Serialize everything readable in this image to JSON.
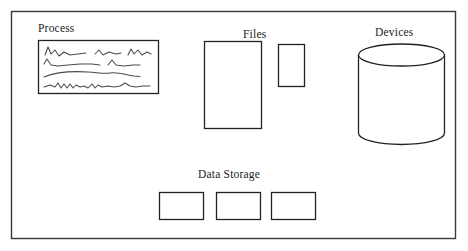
{
  "diagram": {
    "background_color": "#ffffff",
    "frame": {
      "name": "outer-frame",
      "stroke_color": "#333333",
      "x": 11,
      "y": 11,
      "width": 444,
      "height": 228
    },
    "groups": [
      {
        "id": "process",
        "label": "Process",
        "shape": "rectangle-with-scribbles",
        "label_x": 38,
        "label_y": 22,
        "box": {
          "x": 38,
          "y": 40,
          "width": 120,
          "height": 53
        },
        "scribble_rows": 4,
        "stroke_color": "#222222"
      },
      {
        "id": "files",
        "label": "Files",
        "shape": "rectangles",
        "label_x": 243,
        "label_y": 28,
        "rects": [
          {
            "name": "file-rect-large",
            "x": 204,
            "y": 41,
            "width": 57,
            "height": 87
          },
          {
            "name": "file-rect-small",
            "x": 278,
            "y": 44,
            "width": 26,
            "height": 42
          }
        ],
        "stroke_color": "#222222"
      },
      {
        "id": "devices",
        "label": "Devices",
        "shape": "cylinder",
        "label_x": 375,
        "label_y": 26,
        "cylinder": {
          "x": 358,
          "y": 44,
          "width": 86,
          "height": 100,
          "ellipse_ry": 11
        },
        "stroke_color": "#222222"
      },
      {
        "id": "data-storage",
        "label": "Data Storage",
        "shape": "rectangles",
        "label_x": 198,
        "label_y": 168,
        "rects": [
          {
            "name": "storage-rect-1",
            "x": 159,
            "y": 192,
            "width": 44,
            "height": 27
          },
          {
            "name": "storage-rect-2",
            "x": 216,
            "y": 192,
            "width": 44,
            "height": 27
          },
          {
            "name": "storage-rect-3",
            "x": 271,
            "y": 192,
            "width": 44,
            "height": 27
          }
        ],
        "stroke_color": "#222222"
      }
    ]
  }
}
